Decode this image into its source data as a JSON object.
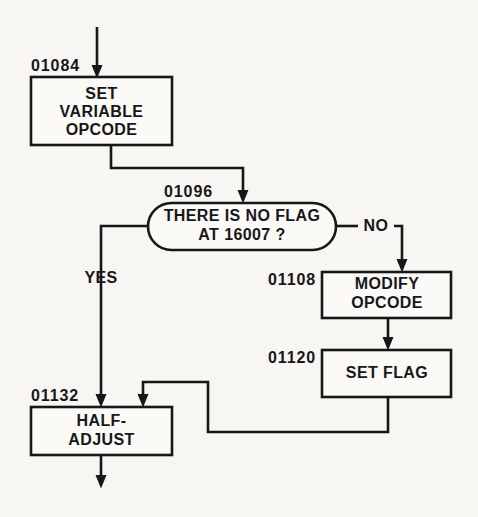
{
  "diagram": {
    "background_color": "#f7f6f2",
    "stroke_color": "#17171a",
    "shape_fill": "#fbfaf7",
    "nodes": [
      {
        "id": "set-variable-opcode",
        "shape": "process",
        "address": "01084",
        "lines": [
          "SET",
          "VARIABLE",
          "OPCODE"
        ]
      },
      {
        "id": "there-is-no-flag",
        "shape": "decision",
        "address": "01096",
        "lines": [
          "THERE IS NO FLAG",
          "AT 16007  ?"
        ]
      },
      {
        "id": "modify-opcode",
        "shape": "process",
        "address": "01108",
        "lines": [
          "MODIFY",
          "OPCODE"
        ]
      },
      {
        "id": "set-flag",
        "shape": "process",
        "address": "01120",
        "lines": [
          "SET FLAG"
        ]
      },
      {
        "id": "half-adjust",
        "shape": "process",
        "address": "01132",
        "lines": [
          "HALF-",
          "ADJUST"
        ]
      }
    ],
    "edge_labels": {
      "yes": "YES",
      "no": "NO"
    }
  }
}
